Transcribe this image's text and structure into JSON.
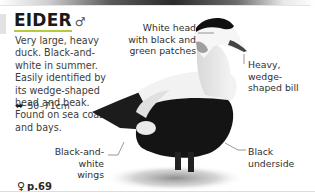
{
  "entry": {
    "name": "EIDER",
    "sex_symbol": "♂",
    "description": "Very large, heavy duck. Black-and-white in summer. Easily identified by its wedge-shaped head and beak. Found on sea coast and bays.",
    "size_icon": "double-arrow-icon",
    "size": "50–71cm",
    "page_ref_symbol": "♀",
    "page_ref": "p.69"
  },
  "annotations": {
    "head": "White head with black and green patches",
    "bill": "Heavy, wedge-shaped bill",
    "wings": "Black-and-white wings",
    "underside": "Black underside"
  },
  "colors": {
    "accent_underline": "#b9c93a",
    "text": "#3a3a3a",
    "bird_black": "#141414"
  }
}
